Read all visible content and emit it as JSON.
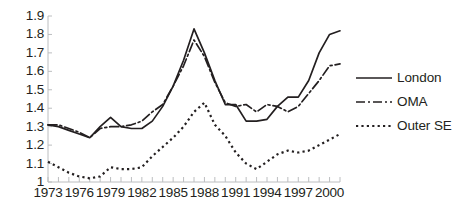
{
  "chart_data": {
    "type": "line",
    "title": "",
    "xlabel": "",
    "ylabel": "",
    "xlim": [
      1973,
      2001
    ],
    "ylim": [
      1.0,
      1.9
    ],
    "grid": false,
    "legend_position": "right",
    "y_ticks": [
      "1.9",
      "1.8",
      "1.7",
      "1.6",
      "1.5",
      "1.4",
      "1.3",
      "1.2",
      "1.1",
      "1"
    ],
    "y_tick_values": [
      1.9,
      1.8,
      1.7,
      1.6,
      1.5,
      1.4,
      1.3,
      1.2,
      1.1,
      1.0
    ],
    "x_tick_labels": [
      "1973",
      "1976",
      "1979",
      "1982",
      "1985",
      "1988",
      "1991",
      "1994",
      "1997",
      "2000"
    ],
    "x_tick_label_values": [
      1973,
      1976,
      1979,
      1982,
      1985,
      1988,
      1991,
      1994,
      1997,
      2000
    ],
    "x_minor_ticks": [
      1973,
      1974,
      1975,
      1976,
      1977,
      1978,
      1979,
      1980,
      1981,
      1982,
      1983,
      1984,
      1985,
      1986,
      1987,
      1988,
      1989,
      1990,
      1991,
      1992,
      1993,
      1994,
      1995,
      1996,
      1997,
      1998,
      1999,
      2000,
      2001
    ],
    "x": [
      1973,
      1974,
      1975,
      1976,
      1977,
      1978,
      1979,
      1980,
      1981,
      1982,
      1983,
      1984,
      1985,
      1986,
      1987,
      1988,
      1989,
      1990,
      1991,
      1992,
      1993,
      1994,
      1995,
      1996,
      1997,
      1998,
      1999,
      2000,
      2001
    ],
    "series": [
      {
        "name": "London",
        "style": "solid",
        "color": "#231f20",
        "values": [
          1.31,
          1.3,
          1.28,
          1.26,
          1.24,
          1.3,
          1.35,
          1.3,
          1.29,
          1.29,
          1.33,
          1.41,
          1.52,
          1.66,
          1.83,
          1.7,
          1.55,
          1.42,
          1.42,
          1.33,
          1.33,
          1.34,
          1.41,
          1.46,
          1.46,
          1.55,
          1.7,
          1.8,
          1.82
        ]
      },
      {
        "name": "OMA",
        "style": "dash-dot",
        "color": "#231f20",
        "values": [
          1.31,
          1.31,
          1.29,
          1.27,
          1.24,
          1.29,
          1.3,
          1.3,
          1.31,
          1.33,
          1.38,
          1.42,
          1.52,
          1.63,
          1.77,
          1.68,
          1.54,
          1.43,
          1.41,
          1.42,
          1.38,
          1.42,
          1.41,
          1.38,
          1.41,
          1.48,
          1.55,
          1.63,
          1.64
        ]
      },
      {
        "name": "Outer SE",
        "style": "dotted",
        "color": "#231f20",
        "values": [
          1.11,
          1.08,
          1.05,
          1.03,
          1.02,
          1.03,
          1.08,
          1.07,
          1.07,
          1.08,
          1.14,
          1.19,
          1.24,
          1.3,
          1.38,
          1.43,
          1.31,
          1.25,
          1.16,
          1.1,
          1.07,
          1.11,
          1.15,
          1.17,
          1.16,
          1.17,
          1.2,
          1.23,
          1.26
        ]
      }
    ]
  },
  "legend": {
    "items": [
      {
        "label": "London",
        "style": "solid"
      },
      {
        "label": "OMA",
        "style": "dash-dot"
      },
      {
        "label": "Outer SE",
        "style": "dotted"
      }
    ]
  }
}
